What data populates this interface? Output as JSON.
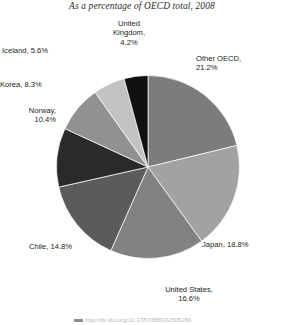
{
  "chart_data": {
    "type": "pie",
    "title": "As a percentage of OECD total, 2008",
    "xlabel": "",
    "ylabel": "",
    "legend_position": "none",
    "grid": false,
    "start_angle_deg": 0,
    "direction": "clockwise",
    "categories": [
      "Other OECD",
      "Japan",
      "United States",
      "Chile",
      "Norway",
      "Korea",
      "Iceland",
      "United Kingdom"
    ],
    "values": [
      21.2,
      18.8,
      16.6,
      14.8,
      10.4,
      8.3,
      5.6,
      4.2
    ],
    "units": "percent",
    "colors": [
      "#7c7c7c",
      "#a2a2a2",
      "#828282",
      "#5b5b5b",
      "#2a2a2a",
      "#919191",
      "#c2c2c2",
      "#111111"
    ],
    "slice_labels": [
      "Other OECD,\n21.2%",
      "Japan, 18.8%",
      "United States,\n16.6%",
      "Chile, 14.8%",
      "Norway,\n10.4%",
      "Korea, 8.3%",
      "Iceland, 5.6%",
      "United\nKingdom,\n4.2%"
    ]
  },
  "labels": {
    "other_oecd": "Other OECD,\n21.2%",
    "japan": "Japan, 18.8%",
    "united_states": "United States,\n16.6%",
    "chile": "Chile, 14.8%",
    "norway": "Norway,\n10.4%",
    "korea": "Korea, 8.3%",
    "iceland": "Iceland, 5.6%",
    "united_kingdom": "United\nKingdom,\n4.2%"
  },
  "source": {
    "text": "http://dx.doi.org/10.1787/888932505286"
  }
}
